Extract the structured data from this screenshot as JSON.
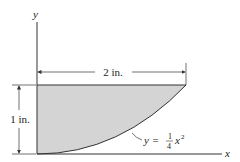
{
  "diagram": {
    "axes": {
      "x_label": "x",
      "y_label": "y"
    },
    "dimensions": {
      "width_label": "2 in.",
      "height_label": "1 in."
    },
    "curve": {
      "equation_lhs": "y =",
      "frac_num": "1",
      "frac_den": "4",
      "var": "x",
      "exponent": "2"
    },
    "colors": {
      "fill": "#d4d4d4",
      "line": "#333333"
    }
  }
}
